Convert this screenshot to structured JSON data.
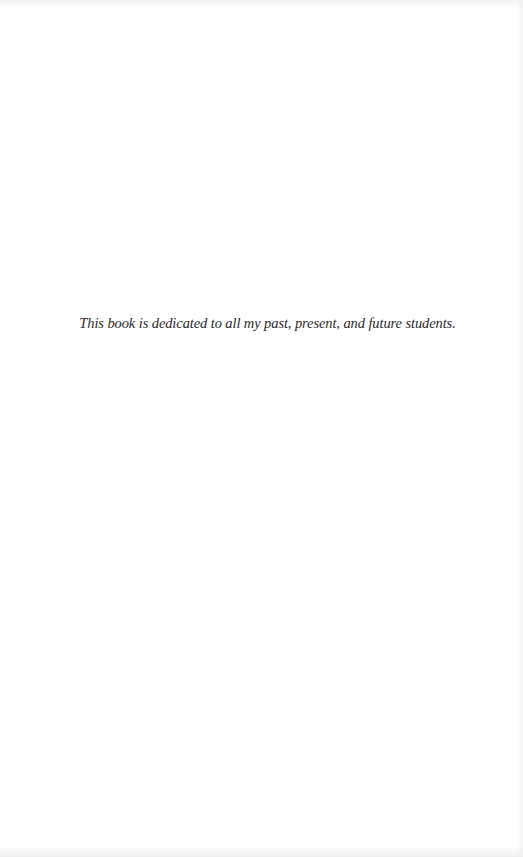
{
  "page": {
    "type": "dedication",
    "dedication_text": "This book is dedicated to all my past, present, and future students."
  }
}
